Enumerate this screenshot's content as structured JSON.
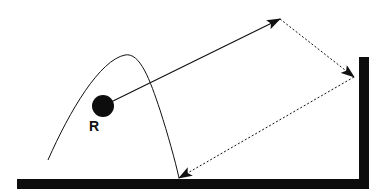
{
  "diagram": {
    "type": "reflection-path-diagram",
    "source_label": "R",
    "colors": {
      "background": "#ffffff",
      "ink": "#111111",
      "surface": "#0d0d0d"
    },
    "elements": {
      "source": {
        "name": "R",
        "shape": "filled-circle",
        "cx": 103,
        "cy": 106,
        "r": 11
      },
      "curve": {
        "style": "thin-solid",
        "description": "arched trajectory from lower-left rising to a peak and descending to the floor"
      },
      "ray_1": {
        "style": "solid-arrow",
        "from": [
          103,
          106
        ],
        "to": [
          280,
          19
        ]
      },
      "ray_2": {
        "style": "dotted-arrow",
        "from": [
          280,
          19
        ],
        "to": [
          354,
          77
        ]
      },
      "ray_3": {
        "style": "dotted-arrow",
        "from": [
          354,
          77
        ],
        "to": [
          179,
          178
        ]
      },
      "floor": {
        "shape": "thick-bar",
        "x": 17,
        "y": 179,
        "width": 352,
        "height": 10
      },
      "wall": {
        "shape": "thick-bar",
        "x": 359,
        "y": 57,
        "width": 10,
        "height": 132
      }
    }
  }
}
